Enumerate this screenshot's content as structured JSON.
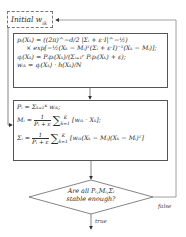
{
  "diagram": {
    "type": "flowchart",
    "start": {
      "label": "Initial w",
      "subscript": "ik",
      "style": "dashed"
    },
    "step1": {
      "lines": [
        "p_i(X_k) = ((2π)^(-d/2) |Σ_i + ε·I|^(-1/2))",
        "× exp[-½(X_k − M_i)^T (Σ_i + ε·I)^(-1) (X_k − M_i)];",
        "q_i(X_k) = P_i p_i(X_k) / (Σ_{i=1}^{C} P_i p_i(X_k) + ε);",
        "w_ik = q_i(X_k) · h(X_k) / N"
      ],
      "l1": "pᵢ(Xₖ) = ((2π)^−d/2 |Σᵢ + ε·I|^−½)",
      "l2": "× exp[−½(Xₖ − Mᵢ)ᵀ(Σᵢ + ε·I)⁻¹(Xₖ − Mᵢ)];",
      "l3": "qᵢ(Xₖ) = Pᵢpᵢ(Xₖ)/(Σᵢ₌₁ᶜ Pᵢpᵢ(Xₖ) + ε);",
      "l4": "wᵢₖ = qᵢ(Xₖ) · h(Xₖ)/N"
    },
    "step2": {
      "lines": [
        "P_i = Σ_{k=1}^{K} w_ik;",
        "M_i = 1/(P_i + ε) Σ_{k=1}^{K} [w_ik · X_k];",
        "Σ_i = 1/(P_i + ε) Σ_{k=1}^{K} [w_ik (X_k − M_i)(X_k − M_i)^T]"
      ],
      "l1": "Pᵢ = Σₖ₌₁ᴷ wᵢₖ;",
      "m_lhs": "Mᵢ =",
      "m_rhs": "[wᵢₖ · Xₖ];",
      "s_lhs": "Σᵢ =",
      "s_rhs": "[wᵢₖ(Xₖ − Mᵢ)(Xₖ − Mᵢ)ᵀ]",
      "frac_num": "1",
      "frac_den": "Pᵢ + ε",
      "sum_sym": "∑",
      "sum_top": "K",
      "sum_bot": "k=1"
    },
    "decision": {
      "line1": "Are all Pᵢ,Mᵢ,Σᵢ",
      "line2": "stable enough?"
    },
    "edges": {
      "false_label": "false",
      "true_label": "true"
    },
    "colors": {
      "stroke": "#555555",
      "text": "#2a2a2a",
      "background": "#ffffff"
    }
  }
}
